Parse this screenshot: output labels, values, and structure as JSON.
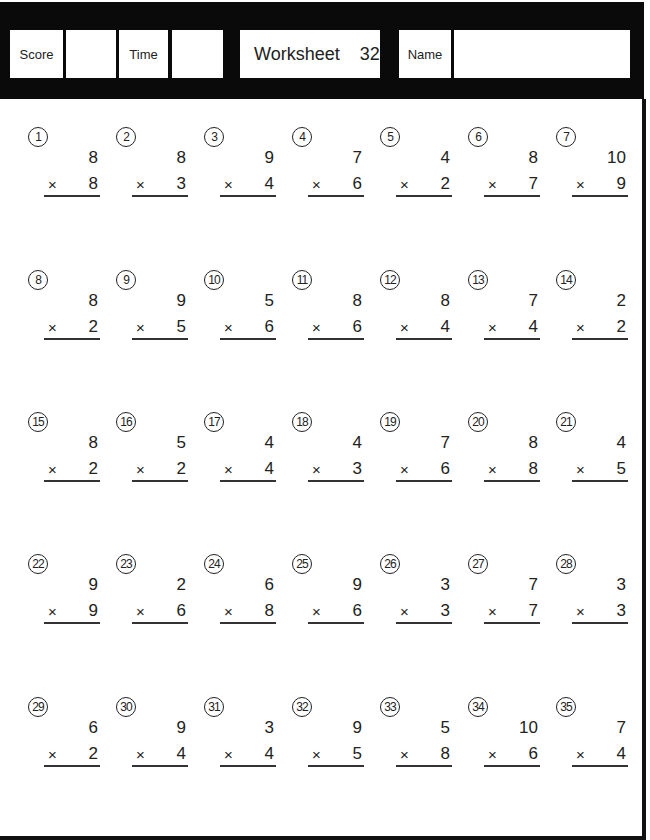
{
  "header": {
    "score_label": "Score",
    "score_value": "",
    "time_label": "Time",
    "time_value": "",
    "worksheet_label": "Worksheet",
    "worksheet_number": "32",
    "name_label": "Name",
    "name_value": ""
  },
  "operator": "×",
  "problems": [
    {
      "num": "1",
      "top": "8",
      "bottom": "8"
    },
    {
      "num": "2",
      "top": "8",
      "bottom": "3"
    },
    {
      "num": "3",
      "top": "9",
      "bottom": "4"
    },
    {
      "num": "4",
      "top": "7",
      "bottom": "6"
    },
    {
      "num": "5",
      "top": "4",
      "bottom": "2"
    },
    {
      "num": "6",
      "top": "8",
      "bottom": "7"
    },
    {
      "num": "7",
      "top": "10",
      "bottom": "9"
    },
    {
      "num": "8",
      "top": "8",
      "bottom": "2"
    },
    {
      "num": "9",
      "top": "9",
      "bottom": "5"
    },
    {
      "num": "10",
      "top": "5",
      "bottom": "6"
    },
    {
      "num": "11",
      "top": "8",
      "bottom": "6"
    },
    {
      "num": "12",
      "top": "8",
      "bottom": "4"
    },
    {
      "num": "13",
      "top": "7",
      "bottom": "4"
    },
    {
      "num": "14",
      "top": "2",
      "bottom": "2"
    },
    {
      "num": "15",
      "top": "8",
      "bottom": "2"
    },
    {
      "num": "16",
      "top": "5",
      "bottom": "2"
    },
    {
      "num": "17",
      "top": "4",
      "bottom": "4"
    },
    {
      "num": "18",
      "top": "4",
      "bottom": "3"
    },
    {
      "num": "19",
      "top": "7",
      "bottom": "6"
    },
    {
      "num": "20",
      "top": "8",
      "bottom": "8"
    },
    {
      "num": "21",
      "top": "4",
      "bottom": "5"
    },
    {
      "num": "22",
      "top": "9",
      "bottom": "9"
    },
    {
      "num": "23",
      "top": "2",
      "bottom": "6"
    },
    {
      "num": "24",
      "top": "6",
      "bottom": "8"
    },
    {
      "num": "25",
      "top": "9",
      "bottom": "6"
    },
    {
      "num": "26",
      "top": "3",
      "bottom": "3"
    },
    {
      "num": "27",
      "top": "7",
      "bottom": "7"
    },
    {
      "num": "28",
      "top": "3",
      "bottom": "3"
    },
    {
      "num": "29",
      "top": "6",
      "bottom": "2"
    },
    {
      "num": "30",
      "top": "9",
      "bottom": "4"
    },
    {
      "num": "31",
      "top": "3",
      "bottom": "4"
    },
    {
      "num": "32",
      "top": "9",
      "bottom": "5"
    },
    {
      "num": "33",
      "top": "5",
      "bottom": "8"
    },
    {
      "num": "34",
      "top": "10",
      "bottom": "6"
    },
    {
      "num": "35",
      "top": "7",
      "bottom": "4"
    }
  ]
}
